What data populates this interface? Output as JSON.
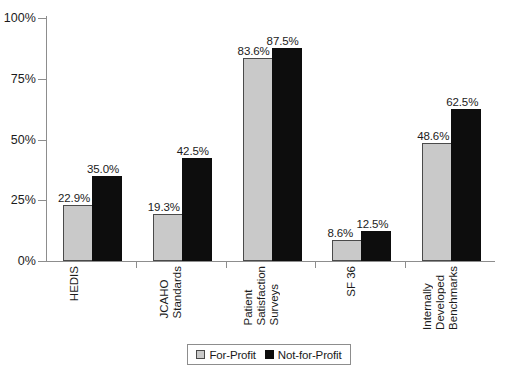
{
  "chart_data": {
    "type": "bar",
    "title": "",
    "xlabel": "",
    "ylabel": "",
    "ylim": [
      0,
      100
    ],
    "yticks": [
      "0%",
      "25%",
      "50%",
      "75%",
      "100%"
    ],
    "ytick_values": [
      0,
      25,
      50,
      75,
      100
    ],
    "grid": false,
    "legend_position": "bottom-center",
    "categories": [
      "HEDIS",
      "JCAHO Standards",
      "Patient Satisfaction Surveys",
      "SF 36",
      "Internally Developed Benchmarks"
    ],
    "category_lines": [
      [
        "HEDIS"
      ],
      [
        "JCAHO",
        "Standards"
      ],
      [
        "Patient",
        "Satisfaction",
        "Surveys"
      ],
      [
        "SF 36"
      ],
      [
        "Internally",
        "Developed",
        "Benchmarks"
      ]
    ],
    "series": [
      {
        "name": "For-Profit",
        "color": "#c9c9c9",
        "values": [
          22.9,
          19.3,
          83.6,
          8.6,
          48.6
        ],
        "labels": [
          "22.9%",
          "19.3%",
          "83.6%",
          "8.6%",
          "48.6%"
        ]
      },
      {
        "name": "Not-for-Profit",
        "color": "#0d0d0d",
        "values": [
          35.0,
          42.5,
          87.5,
          12.5,
          62.5
        ],
        "labels": [
          "35.0%",
          "42.5%",
          "87.5%",
          "12.5%",
          "62.5%"
        ]
      }
    ]
  },
  "legend": {
    "items": [
      {
        "label": "For-Profit",
        "swatch": "light"
      },
      {
        "label": "Not-for-Profit",
        "swatch": "dark"
      }
    ]
  }
}
